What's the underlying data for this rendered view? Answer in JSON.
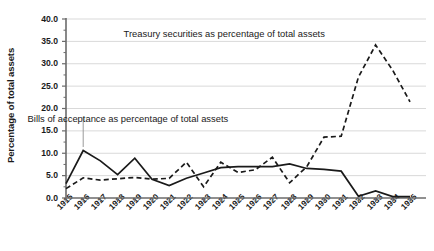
{
  "chart_data": {
    "type": "line",
    "title": "",
    "xlabel": "",
    "ylabel": "Percentage of total assets",
    "xlim": [
      1915,
      1935
    ],
    "ylim": [
      0.0,
      40.0
    ],
    "grid": true,
    "legend_position": "inline-annotations",
    "categories": [
      1915,
      1916,
      1917,
      1918,
      1919,
      1920,
      1921,
      1922,
      1923,
      1924,
      1925,
      1926,
      1927,
      1928,
      1929,
      1930,
      1931,
      1932,
      1933,
      1934,
      1935
    ],
    "x_tick_labels": [
      "1915",
      "1916",
      "1917",
      "1918",
      "1919",
      "1920",
      "1921",
      "1922",
      "1923",
      "1924",
      "1925",
      "1926",
      "1927",
      "1928",
      "1929",
      "1930",
      "1931",
      "1932",
      "1933",
      "1934",
      "1935"
    ],
    "y_tick_labels": [
      "40.0",
      "35.0",
      "30.0",
      "25.0",
      "20.0",
      "15.0",
      "10.0",
      "5.0",
      "0.0"
    ],
    "y_tick_values": [
      40.0,
      35.0,
      30.0,
      25.0,
      20.0,
      15.0,
      10.0,
      5.0,
      0.0
    ],
    "series": [
      {
        "name": "Bills of acceptance as percentage of total assets",
        "style": "solid",
        "color": "#1a1a1a",
        "values": [
          3.2,
          10.6,
          8.3,
          5.2,
          8.9,
          4.2,
          2.8,
          4.4,
          5.6,
          6.8,
          7.0,
          7.0,
          7.0,
          7.6,
          6.6,
          6.4,
          6.0,
          0.4,
          1.6,
          0.3,
          0.3
        ]
      },
      {
        "name": "Treasury securities as percentage of total assets",
        "style": "dashed",
        "color": "#1a1a1a",
        "values": [
          2.1,
          4.5,
          4.0,
          4.3,
          4.6,
          4.2,
          4.4,
          8.0,
          2.5,
          8.0,
          5.7,
          6.3,
          9.1,
          3.4,
          7.0,
          13.6,
          13.8,
          27.0,
          34.2,
          28.5,
          21.5
        ]
      }
    ],
    "annotations": [
      {
        "name": "treasury-label",
        "text": "Treasury securities as percentage of total assets",
        "x": 1924.2,
        "y": 36.4
      },
      {
        "name": "bills-label",
        "text": "Bills of acceptance as percentage of total assets",
        "x": 1918.6,
        "y": 17.5,
        "leader_to": {
          "x": 1916,
          "y": 11.4
        }
      }
    ]
  },
  "axis_colors": {
    "grid": "#d9d9d9",
    "axis": "#6b6b6b",
    "text": "#1a1a1a"
  }
}
